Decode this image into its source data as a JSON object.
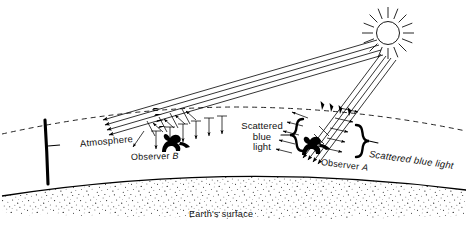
{
  "figure": {
    "background_color": "#ffffff",
    "ink_color": "#000000"
  },
  "labels": {
    "atmosphere": "Atmosphere",
    "observer_b_prefix": "Observer ",
    "observer_b_letter": "B",
    "observer_a_prefix": "Observer ",
    "observer_a_letter": "A",
    "scattered_left_line1": "Scattered",
    "scattered_left_line2": "blue",
    "scattered_left_line3": "light",
    "scattered_right": "Scattered blue light",
    "earth_surface": "Earth's surface"
  },
  "icons": {
    "sun": "sun-icon",
    "observer_a": "observer-figure-icon",
    "observer_b": "observer-figure-icon",
    "left_brace": "curly-brace-left-icon",
    "right_brace": "curly-brace-right-icon",
    "atmosphere_bracket": "bracket-icon"
  },
  "diagram": {
    "sun": {
      "cx": 388,
      "cy": 33,
      "r": 12,
      "ray_count": 16,
      "ray_inner": 15,
      "ray_outer": 26
    },
    "atmosphere_boundary": {
      "type": "dashed-arc",
      "left": [
        2,
        134
      ],
      "peak": [
        232,
        107
      ],
      "right": [
        466,
        131
      ]
    },
    "earth_surface": {
      "type": "solid-arc",
      "left": [
        2,
        196
      ],
      "peak": [
        234,
        166
      ],
      "right": [
        466,
        190
      ]
    },
    "stipple": {
      "fill": "speckled",
      "density": "medium",
      "bottom": 218
    },
    "ray_bundle_b": {
      "count": 4,
      "direction": "down-left-shallow",
      "from": [
        378,
        48
      ],
      "to": [
        100,
        133
      ],
      "arrow": "left"
    },
    "ray_bundle_a": {
      "count": 4,
      "direction": "down-left-steep",
      "from": [
        388,
        52
      ],
      "to": [
        300,
        160
      ],
      "arrow": "down"
    },
    "scatter_arrows_b": {
      "count": 9,
      "note": "short arrows crossing shallow beam toward observer B"
    },
    "scatter_arrows_a": {
      "count": 10,
      "note": "short arrows radiating sideways from steep beam near observer A"
    },
    "observer_b_position": [
      172,
      148
    ],
    "observer_a_position": [
      312,
      152
    ]
  }
}
